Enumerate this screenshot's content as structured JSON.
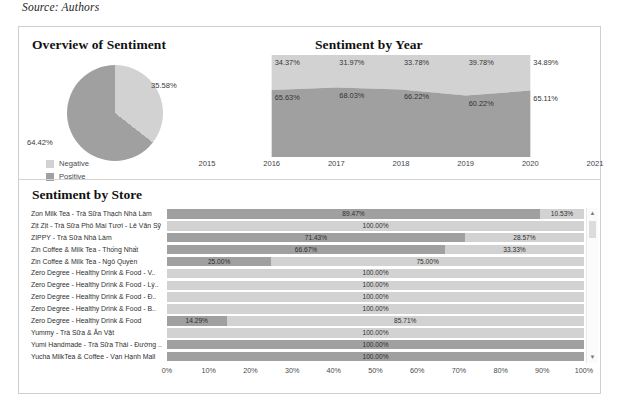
{
  "caption": "Source: Authors",
  "colors": {
    "negative": "#d2d2d2",
    "positive": "#a0a0a0",
    "panel_border": "#cfcfcf",
    "text": "#2b2b2b"
  },
  "overview_panel": {
    "title": "Overview of Sentiment",
    "legend": [
      {
        "label": "Negative",
        "color": "#d2d2d2"
      },
      {
        "label": "Positive",
        "color": "#a0a0a0"
      }
    ],
    "chart_data": {
      "type": "pie",
      "title": "Overview of Sentiment",
      "labels": [
        "Negative",
        "Positive"
      ],
      "values": [
        35.58,
        64.42
      ],
      "value_labels": [
        "35.58%",
        "64.42%"
      ],
      "legend_position": "bottom-left"
    }
  },
  "year_panel": {
    "title": "Sentiment by Year",
    "chart_data": {
      "type": "area",
      "title": "Sentiment by Year",
      "xlabel": "",
      "ylabel": "",
      "x": [
        2016,
        2017,
        2018,
        2019,
        2020
      ],
      "axis_ticks": [
        "2015",
        "2016",
        "2017",
        "2018",
        "2019",
        "2020",
        "2021"
      ],
      "ylim": [
        0,
        100
      ],
      "grid": false,
      "stacked": true,
      "series": [
        {
          "name": "Negative",
          "color": "#d2d2d2",
          "values": [
            34.37,
            31.97,
            33.78,
            39.78,
            34.89
          ],
          "value_labels": [
            "34.37%",
            "31.97%",
            "33.78%",
            "39.78%",
            "34.89%"
          ]
        },
        {
          "name": "Positive",
          "color": "#a0a0a0",
          "values": [
            65.63,
            68.03,
            66.22,
            60.22,
            65.11
          ],
          "value_labels": [
            "65.63%",
            "68.03%",
            "66.22%",
            "60.22%",
            "65.11%"
          ]
        }
      ]
    }
  },
  "store_panel": {
    "title": "Sentiment by Store",
    "scrollbar": {
      "up_icon": "chevron-up-icon",
      "down_icon": "chevron-down-icon"
    },
    "chart_data": {
      "type": "bar",
      "orientation": "horizontal",
      "stacked": true,
      "title": "Sentiment by Store",
      "xlabel": "",
      "ylabel": "",
      "xlim": [
        0,
        100
      ],
      "xticks": [
        "0%",
        "10%",
        "20%",
        "30%",
        "40%",
        "50%",
        "60%",
        "70%",
        "80%",
        "90%",
        "100%"
      ],
      "legend_position": "none",
      "categories": [
        "Zon Milk Tea - Trà Sữa Thạch Nhà Làm",
        "Zịt Zịt - Trà Sữa Phô Mai Tươi - Lê Văn Sỹ",
        "ZIPPY - Trà Sữa Nhà Làm",
        "Zin Coffee & Milk Tea - Thống Nhất",
        "Zin Coffee & Milk Tea - Ngô Quyền",
        "Zero Degree - Healthy Drink & Food - V..",
        "Zero Degree - Healthy Drink & Food - Lý..",
        "Zero Degree - Healthy Drink & Food - Đ..",
        "Zero Degree - Healthy Drink & Food - B..",
        "Zero Degree - Healthy Drink & Food",
        "Yummy - Trà Sữa & Ăn Vặt",
        "Yumi Handmade - Trà Sữa Thái - Đường ..",
        "Yucha MilkTea & Coffee - Vạn Hạnh Mall"
      ],
      "rows": [
        {
          "segments": [
            {
              "series": "Positive",
              "value": 89.47,
              "label": "89.47%",
              "color": "#a0a0a0"
            },
            {
              "series": "Negative",
              "value": 10.53,
              "label": "10.53%",
              "color": "#d2d2d2"
            }
          ]
        },
        {
          "segments": [
            {
              "series": "Negative",
              "value": 100.0,
              "label": "100.00%",
              "color": "#d2d2d2"
            }
          ]
        },
        {
          "segments": [
            {
              "series": "Positive",
              "value": 71.43,
              "label": "71.43%",
              "color": "#a0a0a0"
            },
            {
              "series": "Negative",
              "value": 28.57,
              "label": "28.57%",
              "color": "#d2d2d2"
            }
          ]
        },
        {
          "segments": [
            {
              "series": "Positive",
              "value": 66.67,
              "label": "66.67%",
              "color": "#a0a0a0"
            },
            {
              "series": "Negative",
              "value": 33.33,
              "label": "33.33%",
              "color": "#d2d2d2"
            }
          ]
        },
        {
          "segments": [
            {
              "series": "Positive",
              "value": 25.0,
              "label": "25.00%",
              "color": "#a0a0a0"
            },
            {
              "series": "Negative",
              "value": 75.0,
              "label": "75.00%",
              "color": "#d2d2d2"
            }
          ]
        },
        {
          "segments": [
            {
              "series": "Negative",
              "value": 100.0,
              "label": "100.00%",
              "color": "#d2d2d2"
            }
          ]
        },
        {
          "segments": [
            {
              "series": "Negative",
              "value": 100.0,
              "label": "100.00%",
              "color": "#d2d2d2"
            }
          ]
        },
        {
          "segments": [
            {
              "series": "Negative",
              "value": 100.0,
              "label": "100.00%",
              "color": "#d2d2d2"
            }
          ]
        },
        {
          "segments": [
            {
              "series": "Negative",
              "value": 100.0,
              "label": "100.00%",
              "color": "#d2d2d2"
            }
          ]
        },
        {
          "segments": [
            {
              "series": "Positive",
              "value": 14.29,
              "label": "14.29%",
              "color": "#a0a0a0"
            },
            {
              "series": "Negative",
              "value": 85.71,
              "label": "85.71%",
              "color": "#d2d2d2"
            }
          ]
        },
        {
          "segments": [
            {
              "series": "Negative",
              "value": 100.0,
              "label": "100.00%",
              "color": "#d2d2d2"
            }
          ]
        },
        {
          "segments": [
            {
              "series": "Positive",
              "value": 100.0,
              "label": "100.00%",
              "color": "#a0a0a0"
            }
          ]
        },
        {
          "segments": [
            {
              "series": "Positive",
              "value": 100.0,
              "label": "100.00%",
              "color": "#a0a0a0"
            }
          ]
        }
      ]
    }
  }
}
